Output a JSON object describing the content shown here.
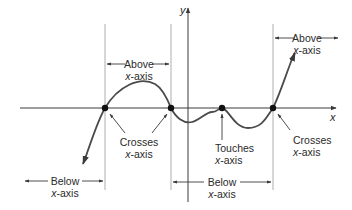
{
  "axes": {
    "x_label": "x",
    "y_label": "y"
  },
  "labels": {
    "above_1": {
      "line1": "Above",
      "line2_var": "x",
      "line2_rest": "-axis"
    },
    "above_2": {
      "line1": "Above",
      "line2_var": "x",
      "line2_rest": "-axis"
    },
    "crosses_1": {
      "line1": "Crosses",
      "line2_var": "x",
      "line2_rest": "-axis"
    },
    "touches": {
      "line1": "Touches",
      "line2_var": "x",
      "line2_rest": "-axis"
    },
    "crosses_2": {
      "line1": "Crosses",
      "line2_var": "x",
      "line2_rest": "-axis"
    },
    "below_1": {
      "line1": "Below",
      "line2_var": "x",
      "line2_rest": "-axis"
    },
    "below_2": {
      "line1": "Below",
      "line2_var": "x",
      "line2_rest": "-axis"
    }
  },
  "points": [
    {
      "x": 105,
      "y": 108,
      "type": "crosses"
    },
    {
      "x": 171,
      "y": 108,
      "type": "crosses"
    },
    {
      "x": 222,
      "y": 108,
      "type": "touches"
    },
    {
      "x": 273,
      "y": 108,
      "type": "crosses"
    }
  ],
  "colors": {
    "curve": "#4a4a4a",
    "axis": "#3a3a3a",
    "guide": "#9a9a9a",
    "text": "#2a2a2a"
  }
}
